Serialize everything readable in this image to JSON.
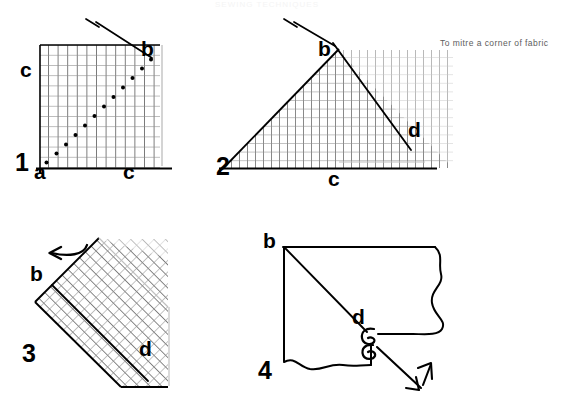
{
  "page": {
    "width": 565,
    "height": 409,
    "background": "#ffffff",
    "ink": "#000000",
    "grid_dark": "#1a1a1a",
    "grid_light": "#9a9a9a",
    "caption_color": "#5d5d5d",
    "ghost_title": "SEWING TECHNIQUES",
    "caption": "To mitre a corner of fabric"
  },
  "figures": [
    {
      "number": "1",
      "name": "step-1-marked-square",
      "description": "Gridded square of fabric with a diagonal line of basting stitches running from corner a up to pinned point b, with a pin placed at b.",
      "labels": {
        "step": "1",
        "corner_a": "a",
        "point_b": "b",
        "edge_c_left": "c",
        "edge_c_bottom": "c"
      },
      "markers": {
        "pin": "pin-marker",
        "stitch_line": "dotted-diagonal"
      }
    },
    {
      "number": "2",
      "name": "step-2-folded-triangle",
      "description": "Fabric folded into a triangle; the fold apex is pinned at b and the stitched line continues from b down to d along the hypotenuse.",
      "labels": {
        "step": "2",
        "point_b": "b",
        "point_d": "d",
        "edge_c_bottom": "c"
      },
      "markers": {
        "pin": "pin-marker",
        "fold_line": "b-to-d-line"
      }
    },
    {
      "number": "3",
      "name": "step-3-rotated-fold",
      "description": "The folded gridded fabric rotated 45 degrees, a curved arrow indicates the direction of folding; b is at the left fold and d is at the lower right.",
      "labels": {
        "step": "3",
        "point_b": "b",
        "point_d": "d"
      },
      "markers": {
        "arrow": "curved-arrow-left",
        "fold_line": "b-to-d-line"
      }
    },
    {
      "number": "4",
      "name": "step-4-finished-mitre",
      "description": "Finished mitred corner shown in outline with torn/wavy raw edges; a knot of thread sits at d and a double headed arrow shows the seam being opened out.",
      "labels": {
        "step": "4",
        "point_b": "b",
        "point_d": "d"
      },
      "markers": {
        "knot": "thread-knot",
        "arrow": "double-headed-arrow"
      }
    }
  ]
}
